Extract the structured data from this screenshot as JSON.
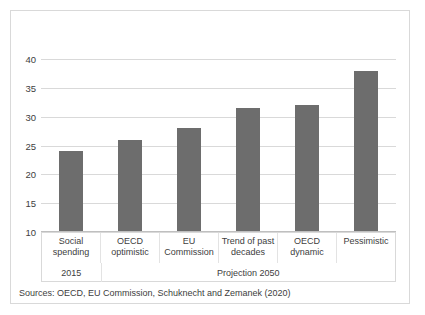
{
  "chart_data": {
    "type": "bar",
    "title": "",
    "xlabel": "",
    "ylabel": "",
    "categories": [
      "Social spending",
      "OECD optimistic",
      "EU Commission",
      "Trend of past decades",
      "OECD dynamic",
      "Pessimistic"
    ],
    "values": [
      24,
      26,
      28,
      31.5,
      32,
      38
    ],
    "ylim": [
      10,
      40
    ],
    "yticks": [
      10,
      15,
      20,
      25,
      30,
      35,
      40
    ],
    "ytick_labels": [
      "10",
      "15",
      "20",
      "25",
      "30",
      "35",
      "40"
    ],
    "grid": true,
    "legend": "none",
    "bar_color": "#6d6d6d",
    "groups": [
      {
        "label": "2015",
        "span": 1
      },
      {
        "label": "Projection 2050",
        "span": 5
      }
    ]
  },
  "source": {
    "text": "Sources: OECD, EU Commission, Schuknecht and Zemanek (2020)"
  }
}
